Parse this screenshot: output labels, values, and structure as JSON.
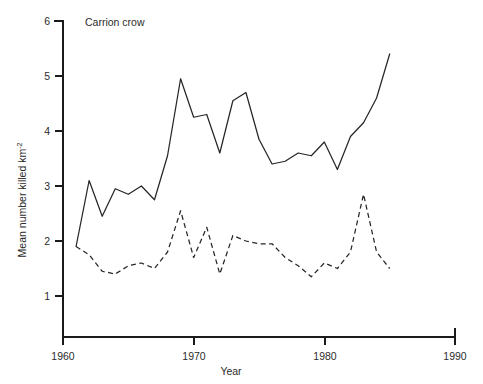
{
  "chart_data": {
    "type": "line",
    "title": "Carrion crow",
    "xlabel": "Year",
    "ylabel_main": "Mean number killed km",
    "ylabel_sup": "-2",
    "xlim": [
      1960,
      1990
    ],
    "ylim": [
      0,
      6
    ],
    "xticks": [
      1960,
      1970,
      1980,
      1990
    ],
    "xtick_labels": [
      "1960",
      "1970",
      "1980",
      "1990"
    ],
    "yticks": [
      1,
      2,
      3,
      4,
      5,
      6
    ],
    "ytick_labels": [
      "1",
      "2",
      "3",
      "4",
      "5",
      "6"
    ],
    "grid": false,
    "legend": "none",
    "line_color": "#262626",
    "axis_color": "#1a1a1a",
    "background": "#ffffff",
    "series": [
      {
        "name": "Carrion crow - solid series",
        "style": "solid",
        "x": [
          1961,
          1962,
          1963,
          1964,
          1965,
          1966,
          1967,
          1968,
          1969,
          1970,
          1971,
          1972,
          1973,
          1974,
          1975,
          1976,
          1977,
          1978,
          1979,
          1980,
          1981,
          1982,
          1983,
          1984,
          1985
        ],
        "values": [
          1.9,
          3.1,
          2.45,
          2.95,
          2.85,
          3.0,
          2.75,
          3.55,
          4.95,
          4.25,
          4.3,
          3.6,
          4.55,
          4.7,
          3.85,
          3.4,
          3.45,
          3.6,
          3.55,
          3.8,
          3.3,
          3.9,
          4.15,
          4.6,
          5.4
        ]
      },
      {
        "name": "Carrion crow - dashed series",
        "style": "dashed",
        "x": [
          1961,
          1962,
          1963,
          1964,
          1965,
          1966,
          1967,
          1968,
          1969,
          1970,
          1971,
          1972,
          1973,
          1974,
          1975,
          1976,
          1977,
          1978,
          1979,
          1980,
          1981,
          1982,
          1983,
          1984,
          1985
        ],
        "values": [
          1.9,
          1.75,
          1.45,
          1.4,
          1.55,
          1.6,
          1.5,
          1.8,
          2.55,
          1.7,
          2.25,
          1.4,
          2.1,
          2.0,
          1.95,
          1.95,
          1.7,
          1.55,
          1.35,
          1.6,
          1.5,
          1.8,
          2.85,
          1.8,
          1.5
        ]
      }
    ]
  }
}
